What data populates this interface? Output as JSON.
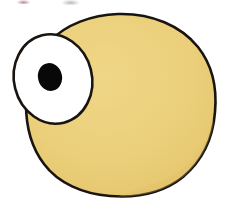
{
  "image": {
    "title": "Cartoon Blob Character",
    "subject": "one-eyed rounded yellow blob creature",
    "medium": "scanned hand-drawn ink and marker illustration",
    "width": 236,
    "height": 211,
    "background_color": "#FFFFFF"
  },
  "palette": {
    "body_fill": "#EBCF7A",
    "body_fill_shade": "#E4C66E",
    "outline": "#1A1410",
    "eye_white": "#FFFFFF",
    "pupil": "#080808",
    "background": "#FFFFFF",
    "scan_mark_red": "#78283C",
    "scan_mark_gray": "#5A5A5F"
  },
  "shapes": {
    "body": {
      "label": "blob-body",
      "description": "large rounded potato-like body, widest at right, flattened toward lower left",
      "fill": "#EBCF7A",
      "stroke": "#1A1410",
      "stroke_width": 2.6,
      "bounds": {
        "x": 25,
        "y": 13,
        "width": 191,
        "height": 184
      },
      "path": "M 118 14 C 152 13 181 26 198 47 C 213 66 217 90 215 112 C 213 138 202 161 183 177 C 163 193 136 198 110 196 C 83 194 58 183 44 164 C 31 147 26 125 26 104 C 26 82 33 59 49 42 C 66 24 92 15 118 14 Z"
    },
    "eye": {
      "label": "eye-white",
      "description": "large white oval eye protruding past the left edge of the body, tilted counter-clockwise",
      "fill": "#FFFFFF",
      "stroke": "#1A1410",
      "stroke_width": 2.6,
      "center": {
        "cx": 53,
        "cy": 79
      },
      "radius": {
        "rx": 39,
        "ry": 45
      },
      "rotation_deg": -14
    },
    "pupil": {
      "label": "pupil",
      "description": "solid black oval pupil set left-of-center and slightly low within the eye",
      "fill": "#080808",
      "center": {
        "cx": 50,
        "cy": 77
      },
      "radius": {
        "rx": 12,
        "ry": 14
      },
      "rotation_deg": -14
    }
  },
  "artifacts": [
    {
      "name": "scan-mark-left",
      "description": "faint reddish ink smudge clipped at the top edge of the scan",
      "x": 17,
      "y": 0,
      "width": 13,
      "height": 4,
      "color": "#78283C"
    },
    {
      "name": "scan-mark-right",
      "description": "faint gray pencil smudge clipped at the top edge of the scan",
      "x": 62,
      "y": 0,
      "width": 17,
      "height": 5,
      "color": "#5A5A5F"
    }
  ]
}
